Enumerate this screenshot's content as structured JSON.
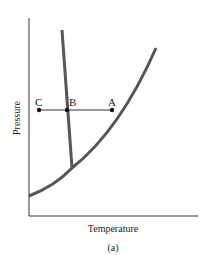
{
  "diagram": {
    "ylabel": "Pressure",
    "xlabel": "Temperature",
    "caption": "(a)",
    "points": [
      {
        "label": "C"
      },
      {
        "label": "B"
      },
      {
        "label": "A"
      }
    ],
    "colors": {
      "curve": "#555555",
      "axis": "#333333",
      "text": "#222222"
    }
  }
}
